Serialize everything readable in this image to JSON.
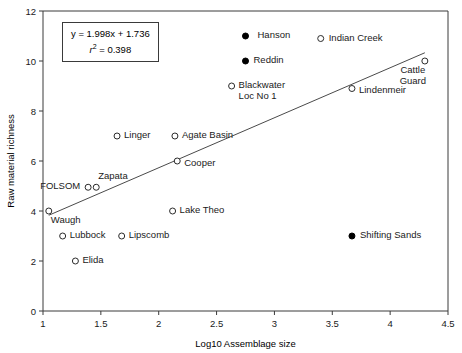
{
  "chart_data": {
    "type": "scatter",
    "title": "",
    "xlabel": "Log10 Assemblage size",
    "ylabel": "Raw material richness",
    "xlim": [
      1,
      4.5
    ],
    "ylim": [
      0,
      12
    ],
    "xticks": [
      "1",
      "1.5",
      "2",
      "2.5",
      "3",
      "3.5",
      "4",
      "4.5"
    ],
    "yticks": [
      "0",
      "2",
      "4",
      "6",
      "8",
      "10",
      "12"
    ],
    "grid": false,
    "legend": "none",
    "annotations": {
      "equation": "y = 1.998x + 1.736",
      "r_squared_label": "r",
      "r_squared_exp": "2",
      "r_squared_value": "= 0.398"
    },
    "trendline": {
      "slope": 1.998,
      "intercept": 1.736,
      "x_start": 1.05,
      "x_end": 4.3,
      "y_start": 3.83,
      "y_end": 10.33
    },
    "points": [
      {
        "label": "Hanson",
        "x": 2.75,
        "y": 11.0,
        "fill": "solid",
        "lx": 12,
        "ly": -6,
        "align": "left"
      },
      {
        "label": "Indian Creek",
        "x": 3.4,
        "y": 10.9,
        "fill": "open",
        "lx": 8,
        "ly": -6,
        "align": "left"
      },
      {
        "label": "Reddin",
        "x": 2.75,
        "y": 10.0,
        "fill": "solid",
        "lx": 8,
        "ly": -6,
        "align": "left"
      },
      {
        "label": "Cattle\nGuard",
        "x": 4.3,
        "y": 10.0,
        "fill": "open",
        "lx": -12,
        "ly": 4,
        "align": "ctr"
      },
      {
        "label": "Blackwater\nLoc No 1",
        "x": 2.63,
        "y": 9.0,
        "fill": "open",
        "lx": 7,
        "ly": -6,
        "align": "left"
      },
      {
        "label": "Lindenmeir",
        "x": 3.67,
        "y": 8.9,
        "fill": "open",
        "lx": 7,
        "ly": -4,
        "align": "left"
      },
      {
        "label": "Linger",
        "x": 1.64,
        "y": 7.0,
        "fill": "open",
        "lx": 7,
        "ly": -6,
        "align": "left"
      },
      {
        "label": "Agate Basin",
        "x": 2.14,
        "y": 7.0,
        "fill": "open",
        "lx": 7,
        "ly": -6,
        "align": "left"
      },
      {
        "label": "Cooper",
        "x": 2.16,
        "y": 6.0,
        "fill": "open",
        "lx": 7,
        "ly": -3,
        "align": "left"
      },
      {
        "label": "Zapata",
        "x": 1.46,
        "y": 4.95,
        "fill": "open",
        "lx": 2,
        "ly": -16,
        "align": "left"
      },
      {
        "label": "FOLSOM",
        "x": 1.39,
        "y": 4.95,
        "fill": "open",
        "lx": -48,
        "ly": -6,
        "align": "left"
      },
      {
        "label": "Waugh",
        "x": 1.05,
        "y": 4.0,
        "fill": "open",
        "lx": 2,
        "ly": 4,
        "align": "left"
      },
      {
        "label": "Lake Theo",
        "x": 2.12,
        "y": 4.0,
        "fill": "open",
        "lx": 7,
        "ly": -6,
        "align": "left"
      },
      {
        "label": "Lubbock",
        "x": 1.17,
        "y": 3.0,
        "fill": "open",
        "lx": 7,
        "ly": -6,
        "align": "left"
      },
      {
        "label": "Lipscomb",
        "x": 1.68,
        "y": 3.0,
        "fill": "open",
        "lx": 7,
        "ly": -6,
        "align": "left"
      },
      {
        "label": "Shifting Sands",
        "x": 3.67,
        "y": 3.0,
        "fill": "solid",
        "lx": 8,
        "ly": -6,
        "align": "left"
      },
      {
        "label": "Elida",
        "x": 1.28,
        "y": 2.0,
        "fill": "open",
        "lx": 7,
        "ly": -6,
        "align": "left"
      }
    ]
  },
  "colors": {
    "axis": "#3a3a3a",
    "marker_open_stroke": "#2b2b2b",
    "marker_solid": "#000000",
    "trendline": "#4a4a4a",
    "text": "#1a1a1a"
  }
}
